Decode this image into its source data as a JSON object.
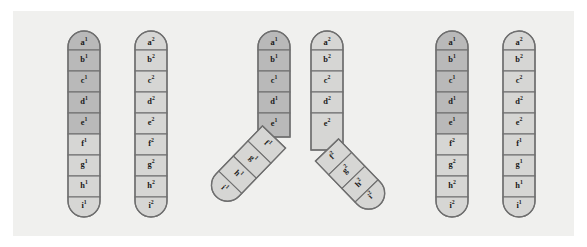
{
  "figure": {
    "background_color": "#f0f0ee",
    "page_color": "#ffffff",
    "segment_dark_color": "#b9b9b9",
    "segment_light_color": "#d6d6d4",
    "outline_color": "#6f6f6f"
  },
  "alleles": {
    "a1": "a",
    "a1s": "1",
    "b1": "b",
    "b1s": "1",
    "c1": "c",
    "c1s": "1",
    "d1": "d",
    "d1s": "1",
    "e1": "e",
    "e1s": "1",
    "f1": "f",
    "f1s": "1",
    "g1": "g",
    "g1s": "1",
    "h1": "h",
    "h1s": "1",
    "i1": "i",
    "i1s": "1",
    "a2": "a",
    "a2s": "2",
    "b2": "b",
    "b2s": "2",
    "c2": "c",
    "c2s": "2",
    "d2": "d",
    "d2s": "2",
    "e2": "e",
    "e2s": "2",
    "f2": "f",
    "f2s": "2",
    "g2": "g",
    "g2s": "2",
    "h2": "h",
    "h2s": "2",
    "i2": "i",
    "i2s": "2"
  },
  "panels": [
    {
      "name": "before-crossover",
      "chromatids": [
        {
          "name": "chromatid-1",
          "shade": "dark-upper-light-lower",
          "segments": [
            {
              "letter": "a",
              "sup": "1",
              "shade": "dark"
            },
            {
              "letter": "b",
              "sup": "1",
              "shade": "dark"
            },
            {
              "letter": "c",
              "sup": "1",
              "shade": "dark"
            },
            {
              "letter": "d",
              "sup": "1",
              "shade": "dark"
            },
            {
              "letter": "e",
              "sup": "1",
              "shade": "dark"
            },
            {
              "letter": "f",
              "sup": "1",
              "shade": "light"
            },
            {
              "letter": "g",
              "sup": "1",
              "shade": "light"
            },
            {
              "letter": "h",
              "sup": "1",
              "shade": "light"
            },
            {
              "letter": "i",
              "sup": "1",
              "shade": "light"
            }
          ]
        },
        {
          "name": "chromatid-2",
          "shade": "light",
          "segments": [
            {
              "letter": "a",
              "sup": "2",
              "shade": "light"
            },
            {
              "letter": "b",
              "sup": "2",
              "shade": "light"
            },
            {
              "letter": "c",
              "sup": "2",
              "shade": "light"
            },
            {
              "letter": "d",
              "sup": "2",
              "shade": "light"
            },
            {
              "letter": "e",
              "sup": "2",
              "shade": "light"
            },
            {
              "letter": "f",
              "sup": "2",
              "shade": "light"
            },
            {
              "letter": "g",
              "sup": "2",
              "shade": "light"
            },
            {
              "letter": "h",
              "sup": "2",
              "shade": "light"
            },
            {
              "letter": "i",
              "sup": "2",
              "shade": "light"
            }
          ]
        }
      ]
    },
    {
      "name": "crossing-over",
      "chromatids": [
        {
          "name": "chromatid-1-crossed",
          "segments": [
            {
              "letter": "a",
              "sup": "1",
              "shade": "dark"
            },
            {
              "letter": "b",
              "sup": "1",
              "shade": "dark"
            },
            {
              "letter": "c",
              "sup": "1",
              "shade": "dark"
            },
            {
              "letter": "d",
              "sup": "1",
              "shade": "dark"
            },
            {
              "letter": "e",
              "sup": "1",
              "shade": "dark"
            },
            {
              "letter": "f",
              "sup": "1",
              "shade": "light"
            },
            {
              "letter": "g",
              "sup": "1",
              "shade": "light"
            },
            {
              "letter": "h",
              "sup": "1",
              "shade": "light"
            },
            {
              "letter": "i",
              "sup": "1",
              "shade": "light"
            }
          ]
        },
        {
          "name": "chromatid-2-crossed",
          "segments": [
            {
              "letter": "a",
              "sup": "2",
              "shade": "light"
            },
            {
              "letter": "b",
              "sup": "2",
              "shade": "light"
            },
            {
              "letter": "c",
              "sup": "2",
              "shade": "light"
            },
            {
              "letter": "d",
              "sup": "2",
              "shade": "light"
            },
            {
              "letter": "e",
              "sup": "2",
              "shade": "light"
            },
            {
              "letter": "f",
              "sup": "2",
              "shade": "light"
            },
            {
              "letter": "g",
              "sup": "2",
              "shade": "light"
            },
            {
              "letter": "h",
              "sup": "2",
              "shade": "light"
            },
            {
              "letter": "i",
              "sup": "2",
              "shade": "light"
            }
          ]
        }
      ]
    },
    {
      "name": "after-crossover-recombinant",
      "chromatids": [
        {
          "name": "recombinant-1",
          "segments": [
            {
              "letter": "a",
              "sup": "1",
              "shade": "dark"
            },
            {
              "letter": "b",
              "sup": "1",
              "shade": "dark"
            },
            {
              "letter": "c",
              "sup": "1",
              "shade": "dark"
            },
            {
              "letter": "d",
              "sup": "1",
              "shade": "dark"
            },
            {
              "letter": "e",
              "sup": "1",
              "shade": "dark"
            },
            {
              "letter": "f",
              "sup": "2",
              "shade": "light"
            },
            {
              "letter": "g",
              "sup": "2",
              "shade": "light"
            },
            {
              "letter": "h",
              "sup": "2",
              "shade": "light"
            },
            {
              "letter": "i",
              "sup": "2",
              "shade": "light"
            }
          ]
        },
        {
          "name": "recombinant-2",
          "segments": [
            {
              "letter": "a",
              "sup": "2",
              "shade": "light"
            },
            {
              "letter": "b",
              "sup": "2",
              "shade": "light"
            },
            {
              "letter": "c",
              "sup": "2",
              "shade": "light"
            },
            {
              "letter": "d",
              "sup": "2",
              "shade": "light"
            },
            {
              "letter": "e",
              "sup": "2",
              "shade": "light"
            },
            {
              "letter": "f",
              "sup": "1",
              "shade": "light"
            },
            {
              "letter": "g",
              "sup": "1",
              "shade": "light"
            },
            {
              "letter": "h",
              "sup": "1",
              "shade": "light"
            },
            {
              "letter": "i",
              "sup": "1",
              "shade": "light"
            }
          ]
        }
      ]
    }
  ]
}
